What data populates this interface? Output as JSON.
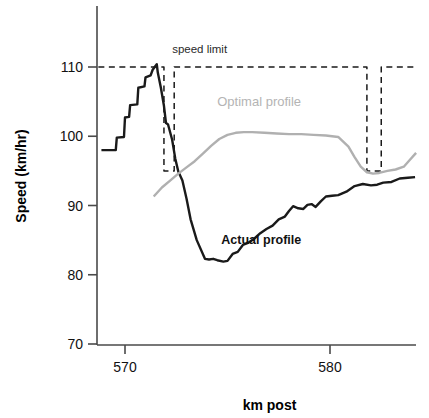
{
  "chart_data": {
    "type": "line",
    "title": "",
    "xlabel": "km post",
    "ylabel": "Speed (km/hr)",
    "xlim": [
      568.7,
      584.2
    ],
    "ylim": [
      70,
      113.5
    ],
    "xticks": [
      570,
      580
    ],
    "xtick_labels": [
      "570",
      "580"
    ],
    "yticks": [
      70,
      80,
      90,
      100,
      110
    ],
    "ytick_labels": [
      "70",
      "80",
      "90",
      "100",
      "110"
    ],
    "grid": false,
    "legend_position": "inline-annotations",
    "annotations": [
      {
        "name": "speed-limit-label",
        "text": "speed limit",
        "x": 572.3,
        "y": 112.0,
        "color": "#2a2a2a"
      },
      {
        "name": "optimal-profile-label",
        "text": "Optimal profile",
        "x": 574.5,
        "y": 104.4,
        "color": "#b4b4b4"
      },
      {
        "name": "actual-profile-label",
        "text": "Actual profile",
        "x": 574.7,
        "y": 84.4,
        "color": "#111111"
      }
    ],
    "series": [
      {
        "name": "speed limit",
        "style": "dashed",
        "color": "#1a1a1a",
        "x": [
          568.7,
          571.9,
          571.9,
          572.4,
          572.4,
          581.8,
          581.8,
          582.5,
          582.5,
          584.2
        ],
        "values": [
          110,
          110,
          95,
          95,
          110,
          110,
          95,
          95,
          110,
          110
        ]
      },
      {
        "name": "Actual profile",
        "style": "solid",
        "color": "#1a1a1a",
        "x": [
          568.85,
          569.55,
          569.6,
          569.95,
          570.0,
          570.2,
          570.25,
          570.6,
          570.65,
          570.95,
          571.0,
          571.25,
          571.35,
          571.55,
          571.6,
          571.75,
          571.9,
          572.0,
          572.1,
          572.3,
          572.45,
          572.6,
          572.8,
          573.0,
          573.2,
          573.5,
          573.9,
          574.1,
          574.3,
          574.5,
          574.8,
          575.0,
          575.25,
          575.5,
          575.75,
          576.0,
          576.3,
          576.6,
          576.9,
          577.2,
          577.5,
          577.8,
          578.0,
          578.2,
          578.45,
          578.7,
          578.9,
          579.1,
          579.3,
          579.55,
          579.8,
          580.1,
          580.4,
          580.8,
          581.2,
          581.6,
          582.0,
          582.3,
          582.6,
          583.0,
          583.4,
          583.8,
          584.15
        ],
        "values": [
          98.0,
          98.0,
          99.8,
          99.9,
          102.7,
          102.8,
          104.5,
          104.6,
          107.0,
          107.2,
          108.5,
          108.8,
          109.6,
          110.4,
          109.2,
          107.0,
          104.4,
          101.9,
          101.7,
          99.5,
          96.8,
          94.9,
          93.6,
          91.0,
          88.0,
          85.0,
          82.3,
          82.2,
          82.3,
          82.1,
          81.9,
          82.0,
          83.0,
          83.3,
          84.3,
          84.6,
          85.2,
          86.0,
          86.6,
          87.1,
          88.0,
          88.4,
          89.2,
          89.9,
          89.6,
          89.5,
          90.1,
          90.2,
          89.8,
          90.6,
          91.3,
          91.4,
          91.5,
          92.0,
          92.8,
          93.1,
          92.9,
          93.0,
          93.3,
          93.4,
          93.9,
          94.0,
          94.1
        ]
      },
      {
        "name": "Optimal profile",
        "style": "solid",
        "color": "#b0b0b0",
        "x": [
          571.4,
          571.8,
          572.2,
          572.6,
          573.0,
          573.4,
          573.8,
          574.2,
          574.6,
          575.0,
          575.4,
          575.8,
          576.2,
          576.8,
          577.4,
          578.0,
          578.6,
          579.2,
          579.8,
          580.4,
          580.9,
          581.2,
          581.5,
          581.8,
          582.1,
          582.4,
          582.8,
          583.2,
          583.6,
          583.9,
          584.2
        ],
        "values": [
          91.3,
          92.6,
          93.6,
          94.6,
          95.5,
          96.4,
          97.5,
          98.6,
          99.6,
          100.2,
          100.5,
          100.6,
          100.6,
          100.5,
          100.4,
          100.3,
          100.3,
          100.2,
          100.1,
          99.9,
          98.5,
          97.0,
          95.6,
          94.8,
          94.6,
          94.7,
          95.0,
          95.2,
          95.6,
          96.6,
          97.6
        ]
      }
    ]
  },
  "axis": {
    "y_title": "Speed (km/hr)",
    "x_title": "km post"
  }
}
